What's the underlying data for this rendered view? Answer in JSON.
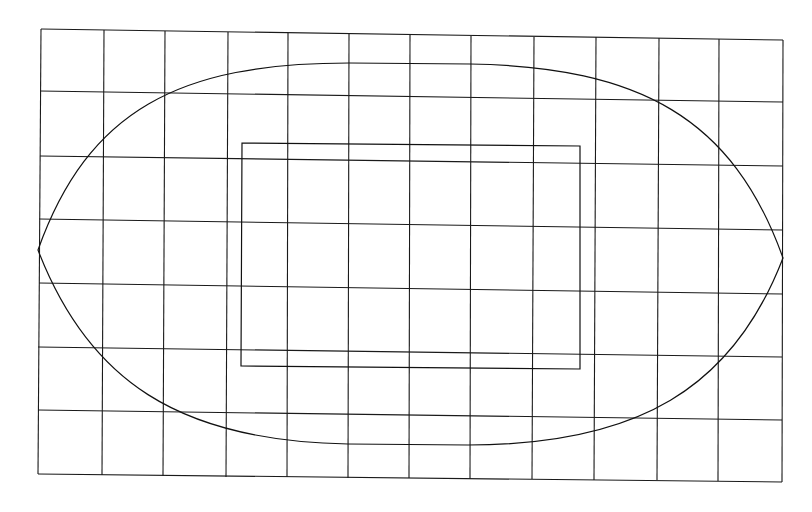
{
  "diagram": {
    "type": "grid-with-lens-and-rectangle",
    "colors": {
      "background": "#ffffff",
      "line": "#1a1a1a"
    },
    "grid": {
      "vertical_lines": [
        [
          41,
          29,
          38,
          474
        ],
        [
          104,
          30,
          102,
          475
        ],
        [
          165,
          31,
          163,
          476
        ],
        [
          228,
          32,
          226,
          477
        ],
        [
          288,
          33,
          287,
          477
        ],
        [
          349,
          34,
          348,
          478
        ],
        [
          410,
          35,
          409,
          478
        ],
        [
          471,
          36,
          470,
          479
        ],
        [
          534,
          37,
          532,
          479
        ],
        [
          596,
          37,
          594,
          480
        ],
        [
          659,
          38,
          657,
          480
        ],
        [
          719,
          39,
          718,
          481
        ],
        [
          783,
          40,
          782,
          482
        ]
      ],
      "horizontal_lines": [
        [
          41,
          29,
          783,
          40
        ],
        [
          40,
          91,
          783,
          102
        ],
        [
          40,
          156,
          783,
          166
        ],
        [
          39,
          219,
          783,
          230
        ],
        [
          39,
          283,
          783,
          294
        ],
        [
          38,
          347,
          782,
          357
        ],
        [
          38,
          410,
          782,
          420
        ],
        [
          38,
          474,
          782,
          482
        ]
      ]
    },
    "lens": {
      "left_tip": [
        38,
        250
      ],
      "right_tip": [
        783,
        258
      ],
      "top_flat": [
        [
          349,
          63
        ],
        [
          470,
          64
        ]
      ],
      "bottom_flat": [
        [
          348,
          444
        ],
        [
          468,
          445
        ]
      ]
    },
    "rectangle": {
      "corners": [
        [
          242,
          143
        ],
        [
          580,
          146
        ],
        [
          580,
          369
        ],
        [
          241,
          366
        ]
      ]
    }
  }
}
